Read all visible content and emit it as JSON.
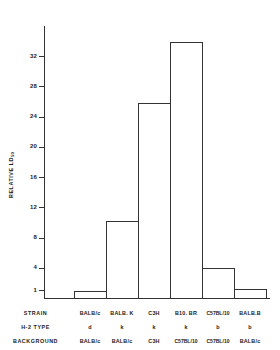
{
  "chart_data": {
    "type": "bar",
    "title": "",
    "xlabel": "",
    "ylabel": "RELATIVE LD",
    "ylabel_sub": "50",
    "categories": [
      "BALB/c",
      "BALB.K",
      "C3H",
      "B10. BR",
      "C57BL/10",
      "BALB.B"
    ],
    "values": [
      1.1,
      10.3,
      26.0,
      34.0,
      4.1,
      1.3
    ],
    "ylim": [
      0,
      36
    ],
    "yticks": [
      1,
      4,
      8,
      12,
      16,
      20,
      24,
      28,
      32
    ],
    "ytick_labels": [
      "1",
      "4",
      "8",
      "12",
      "16",
      "20",
      "24",
      "28",
      "32"
    ],
    "grid": false,
    "legend": null,
    "series": [
      {
        "name": "Relative LD50",
        "values": [
          1.1,
          10.3,
          26.0,
          34.0,
          4.1,
          1.3
        ]
      }
    ],
    "annotation_rows": [
      {
        "header": "STRAIN",
        "values": [
          "BALB/c",
          "BALB. K",
          "C3H",
          "B10. BR",
          "C57BL/10",
          "BALB.B"
        ]
      },
      {
        "header": "H-2 TYPE",
        "values": [
          "d",
          "k",
          "k",
          "k",
          "b",
          "b"
        ]
      },
      {
        "header": "BACKGROUND",
        "values": [
          "BALB/c",
          "BALB/c",
          "C3H",
          "C57BL/10",
          "C57BL/10",
          "BALB/c"
        ]
      }
    ]
  },
  "colors": {
    "axis": "#333333",
    "bar_outline": "#333333",
    "background": "#ffffff",
    "text": "#1a1a1a"
  }
}
